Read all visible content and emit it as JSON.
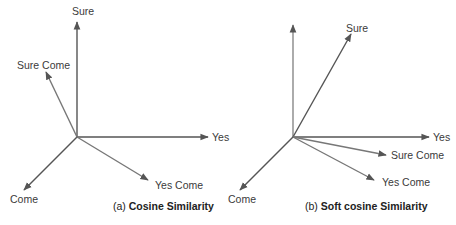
{
  "panels": [
    {
      "id": "a",
      "caption_prefix": "(a)",
      "caption_title": "Cosine Similarity",
      "origin": [
        77,
        137
      ],
      "vectors": [
        {
          "label": "Sure",
          "to": [
            77,
            22
          ],
          "label_pos": [
            72,
            15
          ],
          "color": "#555555"
        },
        {
          "label": "Yes",
          "to": [
            208,
            137
          ],
          "label_pos": [
            212,
            141
          ],
          "color": "#555555"
        },
        {
          "label": "Come",
          "to": [
            24,
            190
          ],
          "label_pos": [
            10,
            203
          ],
          "color": "#555555"
        },
        {
          "label": "Sure Come",
          "to": [
            46,
            72
          ],
          "label_pos": [
            17,
            69
          ],
          "color": "#777777"
        },
        {
          "label": "Yes Come",
          "to": [
            148,
            180
          ],
          "label_pos": [
            155,
            189
          ],
          "color": "#777777"
        }
      ]
    },
    {
      "id": "b",
      "caption_prefix": "(b)",
      "caption_title": "Soft cosine Similarity",
      "origin": [
        293,
        137
      ],
      "vectors": [
        {
          "label": "",
          "to": [
            293,
            25
          ],
          "label_pos": [
            0,
            0
          ],
          "color": "#888888"
        },
        {
          "label": "Sure",
          "to": [
            351,
            34
          ],
          "label_pos": [
            346,
            32
          ],
          "color": "#555555"
        },
        {
          "label": "Yes",
          "to": [
            429,
            137
          ],
          "label_pos": [
            433,
            141
          ],
          "color": "#555555"
        },
        {
          "label": "Come",
          "to": [
            240,
            190
          ],
          "label_pos": [
            228,
            203
          ],
          "color": "#555555"
        },
        {
          "label": "Sure Come",
          "to": [
            386,
            155
          ],
          "label_pos": [
            391,
            159
          ],
          "color": "#777777"
        },
        {
          "label": "Yes Come",
          "to": [
            374,
            180
          ],
          "label_pos": [
            382,
            186
          ],
          "color": "#777777"
        }
      ]
    }
  ]
}
